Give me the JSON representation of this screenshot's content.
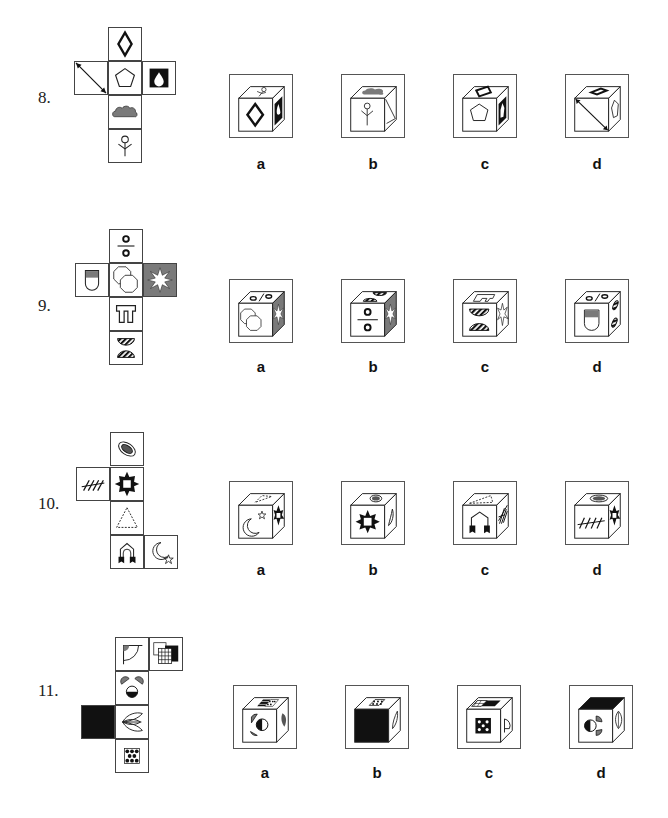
{
  "questions": [
    {
      "number": "8.",
      "net_faces": [
        "diamond-outline",
        "double-arrow-diagonal",
        "pentagon",
        "water-drop-on-black",
        "gray-cloud",
        "stick-figure"
      ],
      "options": [
        {
          "label": "a",
          "front": "diamond-outline",
          "top": "stick-figure",
          "right": "water-drop-on-black"
        },
        {
          "label": "b",
          "front": "stick-figure",
          "top": "gray-cloud",
          "right": "double-arrow-diagonal"
        },
        {
          "label": "c",
          "front": "pentagon",
          "top": "diamond-outline",
          "right": "water-drop-on-black"
        },
        {
          "label": "d",
          "front": "double-arrow-diagonal",
          "top": "diamond-outline",
          "right": "pentagon"
        }
      ]
    },
    {
      "number": "9.",
      "net_faces": [
        "division-circles",
        "half-gray-shield",
        "overlapping-octagons",
        "white-star-on-gray",
        "pi-gate",
        "striped-semicircles"
      ],
      "options": [
        {
          "label": "a",
          "front": "overlapping-octagons",
          "top": "division-circles",
          "right": "white-star-on-gray"
        },
        {
          "label": "b",
          "front": "division-circles",
          "top": "striped-semicircles",
          "right": "white-star-on-gray"
        },
        {
          "label": "c",
          "front": "striped-semicircles",
          "top": "pi-gate",
          "right": "white-star-on-gray"
        },
        {
          "label": "d",
          "front": "half-gray-shield",
          "top": "division-circles",
          "right": "striped-semicircles"
        }
      ]
    },
    {
      "number": "10.",
      "net_faces": [
        "ringed-ellipse",
        "hatch-marks",
        "black-sun",
        "dashed-triangle",
        "arch-with-arrows",
        "moon-and-star"
      ],
      "options": [
        {
          "label": "a",
          "front": "moon-and-star",
          "top": "dashed-triangle",
          "right": "black-sun"
        },
        {
          "label": "b",
          "front": "black-sun",
          "top": "ringed-ellipse",
          "right": "moon-crescent"
        },
        {
          "label": "c",
          "front": "arch-with-arrows",
          "top": "dashed-triangle",
          "right": "hatch-marks"
        },
        {
          "label": "d",
          "front": "hatch-marks",
          "top": "ringed-ellipse",
          "right": "black-sun"
        }
      ]
    },
    {
      "number": "11.",
      "net_faces": [
        "quarter-circle-flag",
        "grid-squares",
        "face-with-semicircles",
        "black-square",
        "leaf-wings",
        "dotted-square"
      ],
      "options": [
        {
          "label": "a",
          "front": "face-with-semicircles",
          "top": "grid-squares",
          "right": "leaf-wings"
        },
        {
          "label": "b",
          "front": "black-square",
          "top": "dotted-square",
          "right": "leaf-wings"
        },
        {
          "label": "c",
          "front": "dotted-square",
          "top": "grid-squares",
          "right": "quarter-circle-flag"
        },
        {
          "label": "d",
          "front": "face-with-semicircles",
          "top": "black-square",
          "right": "leaf-wings"
        }
      ]
    }
  ],
  "colors": {
    "gray_fill": "#7a7a7a",
    "black_fill": "#111111",
    "line": "#222222"
  }
}
